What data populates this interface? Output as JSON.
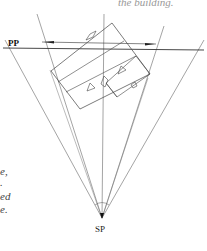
{
  "caption_top": "the building.",
  "labels": {
    "picture_plane": "PP",
    "station_point": "SP"
  },
  "left_text_fragments": [
    "e,",
    ".",
    "ed",
    "e."
  ],
  "colors": {
    "line": "#555555",
    "pp_line": "#333333",
    "text": "#444444",
    "background": "#ffffff"
  }
}
